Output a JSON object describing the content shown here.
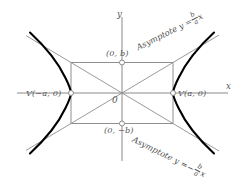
{
  "figure": {
    "type": "hyperbola-diagram",
    "axes": {
      "x_label": "x",
      "y_label": "y",
      "origin_label": "0"
    },
    "points": [
      {
        "name": "vertex-left",
        "label": "V(−a, 0)"
      },
      {
        "name": "vertex-right",
        "label": "V(a, 0)"
      },
      {
        "name": "co-vertex-top",
        "label": "(0, b)"
      },
      {
        "name": "co-vertex-bottom",
        "label": "(0, −b)"
      }
    ],
    "asymptotes": {
      "upper": {
        "caption": "Asymptote",
        "equation_lhs": "y =",
        "numerator": "b",
        "denominator": "a",
        "variable": "x",
        "sign": ""
      },
      "lower": {
        "caption": "Asymptote",
        "equation_lhs": "y =",
        "numerator": "b",
        "denominator": "a",
        "variable": "x",
        "sign": "−"
      }
    },
    "colors": {
      "curve": "#000000",
      "axis": "#8a8a8a",
      "rectangle": "#8f8f8f",
      "diagonal": "#8f8f8f",
      "asymptote": "#8f8f8f",
      "text": "#565656",
      "marker_fill": "#ffffff"
    }
  }
}
